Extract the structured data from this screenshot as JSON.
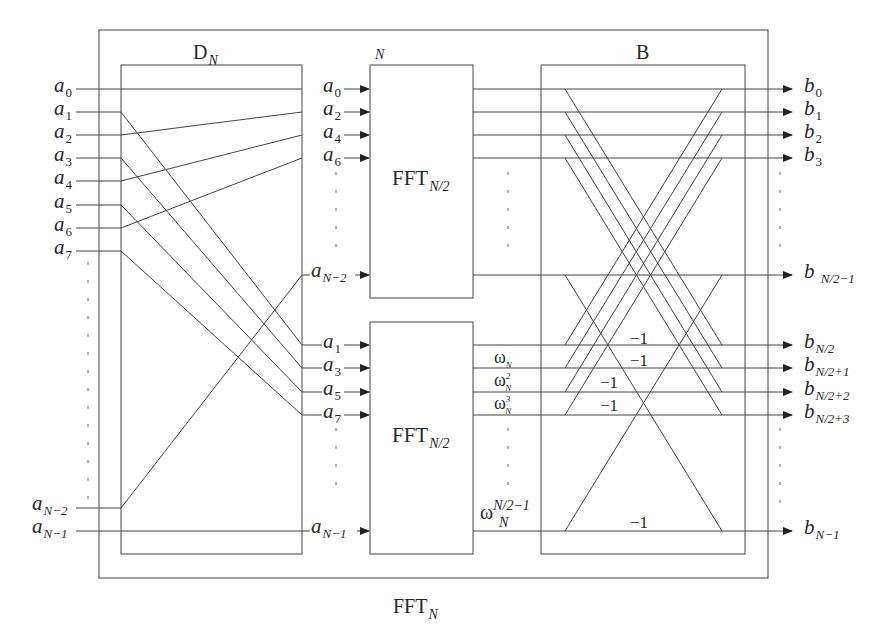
{
  "header": {
    "fragment_text": "·· 1/2 ···· 实现 ···· 111"
  },
  "diagram": {
    "title": "FFT",
    "title_sub": "N",
    "permutation_block": {
      "label": "D",
      "label_sub": "N"
    },
    "butterfly_block": {
      "label": "B"
    },
    "fft_top": {
      "label": "FFT",
      "label_sub": "N/2",
      "corner_label": "N"
    },
    "fft_bottom": {
      "label": "FFT",
      "label_sub": "N/2"
    },
    "inputs": [
      {
        "base": "a",
        "sub": "0"
      },
      {
        "base": "a",
        "sub": "1"
      },
      {
        "base": "a",
        "sub": "2"
      },
      {
        "base": "a",
        "sub": "3"
      },
      {
        "base": "a",
        "sub": "4"
      },
      {
        "base": "a",
        "sub": "5"
      },
      {
        "base": "a",
        "sub": "6"
      },
      {
        "base": "a",
        "sub": "7"
      },
      {
        "base": "a",
        "sub": "N−2"
      },
      {
        "base": "a",
        "sub": "N−1"
      }
    ],
    "even_inputs": [
      {
        "base": "a",
        "sub": "0"
      },
      {
        "base": "a",
        "sub": "2"
      },
      {
        "base": "a",
        "sub": "4"
      },
      {
        "base": "a",
        "sub": "6"
      },
      {
        "base": "a",
        "sub": "N−2"
      }
    ],
    "odd_inputs": [
      {
        "base": "a",
        "sub": "1"
      },
      {
        "base": "a",
        "sub": "3"
      },
      {
        "base": "a",
        "sub": "5"
      },
      {
        "base": "a",
        "sub": "7"
      },
      {
        "base": "a",
        "sub": "N−1"
      }
    ],
    "twiddles": [
      {
        "base": "ω",
        "sub": "N",
        "sup": ""
      },
      {
        "base": "ω",
        "sub": "N",
        "sup": "2"
      },
      {
        "base": "ω",
        "sub": "N",
        "sup": "3"
      },
      {
        "base": "ω",
        "sub": "N",
        "sup": "N/2−1"
      }
    ],
    "outputs": [
      {
        "base": "b",
        "sub": "0"
      },
      {
        "base": "b",
        "sub": "1"
      },
      {
        "base": "b",
        "sub": "2"
      },
      {
        "base": "b",
        "sub": "3"
      },
      {
        "base": "b",
        "sub": "N/2−1"
      },
      {
        "base": "b",
        "sub": "N/2"
      },
      {
        "base": "b",
        "sub": "N/2+1"
      },
      {
        "base": "b",
        "sub": "N/2+2"
      },
      {
        "base": "b",
        "sub": "N/2+3"
      },
      {
        "base": "b",
        "sub": "N−1"
      }
    ],
    "minus_one_labels": [
      "−1",
      "−1",
      "−1",
      "−1",
      "−1"
    ]
  }
}
